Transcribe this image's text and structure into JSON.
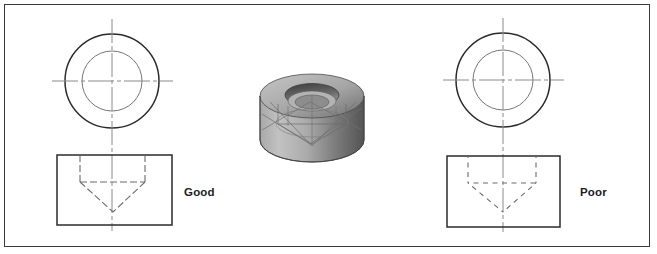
{
  "figure": {
    "background_color": "#ffffff",
    "border_color": "#3a3a3a",
    "width": 657,
    "height": 254
  },
  "labels": {
    "good": "Good",
    "poor": "Poor"
  },
  "colors": {
    "object_line": "#2b2b2b",
    "hidden_line": "#6b6b6b",
    "center_line": "#8a8a8a",
    "thin_circle": "#767676",
    "model_light": "#b9b9b9",
    "model_mid": "#9a9a9a",
    "model_dark": "#4f4f4f",
    "model_shadow": "#6e6e6e",
    "label_text": "#1c1c1c"
  },
  "views": {
    "good": {
      "name": "good-example",
      "top_view": {
        "center_x": 112,
        "center_y": 81,
        "outer_radius": 47,
        "inner_radius": 30,
        "centerline_h_x1": 52,
        "centerline_h_x2": 173,
        "centerline_v_y1": 19,
        "centerline_v_y2": 231
      },
      "front_view": {
        "left": 57,
        "top": 155,
        "right": 172,
        "bottom": 225,
        "counterbore_left_x": 80,
        "counterbore_right_x": 145,
        "counterbore_depth_y": 182,
        "cone_apex_x": 113,
        "cone_apex_y": 212
      },
      "hidden_dash": "7,3",
      "hidden_dash_offset": 0,
      "note": "hidden line dashes meet cleanly at corners and intersections"
    },
    "poor": {
      "name": "poor-example",
      "top_view": {
        "center_x": 503,
        "center_y": 80,
        "outer_radius": 47,
        "inner_radius": 30,
        "centerline_h_x1": 443,
        "centerline_h_x2": 564,
        "centerline_v_y1": 18,
        "centerline_v_y2": 232
      },
      "front_view": {
        "left": 447,
        "top": 156,
        "right": 560,
        "bottom": 227,
        "counterbore_left_x": 468,
        "counterbore_right_x": 536,
        "counterbore_depth_y": 183,
        "cone_apex_x": 503,
        "cone_apex_y": 212
      },
      "hidden_dash": "5,4.5",
      "hidden_dash_offset": 3,
      "note": "hidden line dashes leave gaps at corners and intersections"
    }
  },
  "solid_model": {
    "name": "counterbored-cylinder-3d",
    "description": "Shaded 3D cylinder with counterbored conical hole and wireframe edges",
    "left": 252,
    "top": 68,
    "width": 120,
    "height": 108
  }
}
